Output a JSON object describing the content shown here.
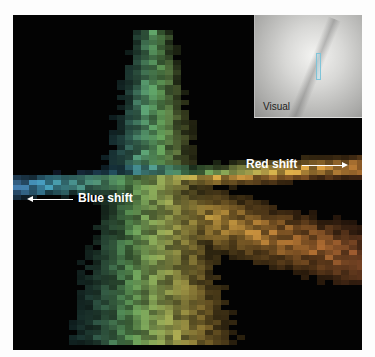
{
  "figure": {
    "background": "#030303",
    "inset": {
      "label": "Visual"
    },
    "annotations": {
      "red_shift": {
        "label": "Red shift",
        "direction": "right"
      },
      "blue_shift": {
        "label": "Blue shift",
        "direction": "left"
      }
    },
    "colors": {
      "blue": "#5a6fc8",
      "cyan": "#4fa6b8",
      "green": "#6fa05a",
      "yellow": "#e3b24a",
      "orange": "#d98a3c",
      "red_brown": "#a45a30"
    }
  }
}
